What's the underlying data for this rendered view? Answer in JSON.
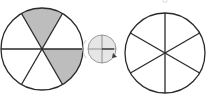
{
  "figure": {
    "colors": {
      "stroke": "#2a2a2a",
      "shade": "#bdbdbd",
      "spinner_fill": "#e6e6e6",
      "background": "#ffffff"
    },
    "left_circle": {
      "parts": 6,
      "shaded_parts": 2,
      "shaded_positions": [
        "top",
        "lower-right"
      ]
    },
    "spinner": {
      "icon": "spinner-icon"
    },
    "right_circle": {
      "parts": 6,
      "shaded_parts": 0
    }
  }
}
